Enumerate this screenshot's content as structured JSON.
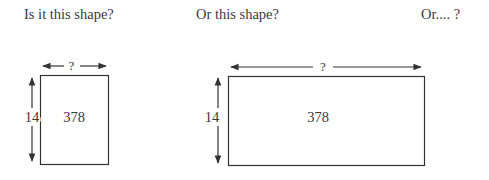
{
  "questions": {
    "first": "Is it this shape?",
    "second": "Or this shape?",
    "third": "Or.... ?"
  },
  "shapes": [
    {
      "area": "378",
      "height_label": "14",
      "width_label": "?"
    },
    {
      "area": "378",
      "height_label": "14",
      "width_label": "?"
    }
  ],
  "colors": {
    "stroke": "#333333",
    "text": "#3a3a3a"
  }
}
